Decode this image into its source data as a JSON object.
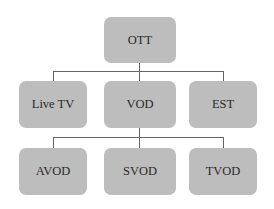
{
  "diagram": {
    "type": "tree",
    "root": {
      "label": "OTT",
      "children": [
        {
          "label": "Live TV",
          "children": []
        },
        {
          "label": "VOD",
          "children": [
            {
              "label": "AVOD",
              "children": []
            },
            {
              "label": "SVOD",
              "children": []
            },
            {
              "label": "TVOD",
              "children": []
            }
          ]
        },
        {
          "label": "EST",
          "children": []
        }
      ]
    },
    "colors": {
      "node_fill": "#bdbdbd",
      "connector": "#666666",
      "text": "#2a2a2a",
      "background": "#ffffff"
    }
  }
}
